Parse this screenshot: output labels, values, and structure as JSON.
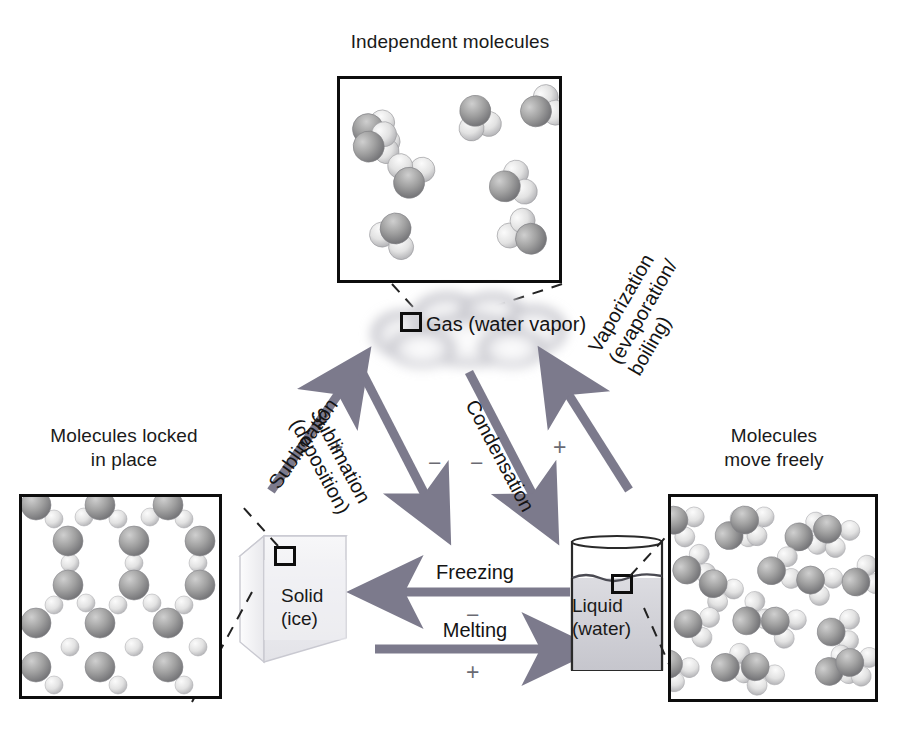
{
  "diagram": {
    "title_gas_panel": "Independent molecules",
    "title_solid_panel": "Molecules locked\nin place",
    "title_liquid_panel": "Molecules\nmove freely",
    "states": {
      "gas": "Gas (water vapor)",
      "solid": "Solid\n(ice)",
      "liquid": "Liquid\n(water)"
    },
    "transitions": [
      {
        "name": "sublimation",
        "label": "Sublimation",
        "sign": "+",
        "direction": "solid-to-gas"
      },
      {
        "name": "deposition",
        "label": "Sublimation\n(deposition)",
        "sign": "−",
        "direction": "gas-to-solid"
      },
      {
        "name": "condensation",
        "label": "Condensation",
        "sign": "−",
        "direction": "gas-to-liquid"
      },
      {
        "name": "vaporization",
        "label": "Vaporization\n(evaporation/\nboiling)",
        "sign": "+",
        "direction": "liquid-to-gas"
      },
      {
        "name": "freezing",
        "label": "Freezing",
        "sign": "−",
        "direction": "liquid-to-solid"
      },
      {
        "name": "melting",
        "label": "Melting",
        "sign": "+",
        "direction": "solid-to-liquid"
      }
    ],
    "colors": {
      "arrow": "#7c7a8c",
      "panel_border": "#0d0d0d",
      "oxygen": "#9a9a9a",
      "hydrogen": "#e2e2e2",
      "text": "#1a1a1a",
      "sign": "#6a6a72",
      "cloud": "#b4b4bc",
      "ice_cube": "#ededf0",
      "water": "#d5d5da"
    }
  }
}
